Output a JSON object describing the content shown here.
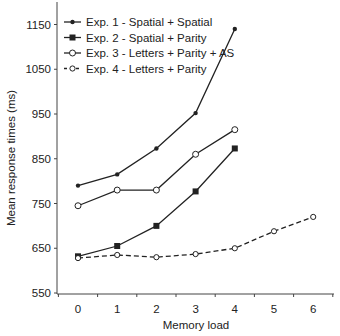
{
  "chart_data": {
    "type": "line",
    "title": "",
    "xlabel": "Memory load",
    "ylabel": "Mean response times (ms)",
    "xlim": [
      -0.5,
      6.5
    ],
    "ylim": [
      550,
      1200
    ],
    "xticks": [
      0,
      1,
      2,
      3,
      4,
      5,
      6
    ],
    "yticks": [
      550,
      650,
      750,
      850,
      950,
      1050,
      1150
    ],
    "grid": false,
    "legend_position": "upper-left",
    "series": [
      {
        "name": "Exp. 1 - Spatial + Spatial",
        "marker": "small-filled-diamond",
        "line": "solid",
        "x": [
          0,
          1,
          2,
          3,
          4
        ],
        "values": [
          790,
          815,
          873,
          952,
          1140
        ]
      },
      {
        "name": "Exp. 2 - Spatial + Parity",
        "marker": "filled-square",
        "line": "solid",
        "x": [
          0,
          1,
          2,
          3,
          4
        ],
        "values": [
          632,
          655,
          700,
          777,
          873
        ]
      },
      {
        "name": "Exp. 3 - Letters + Parity + AS",
        "marker": "open-circle",
        "line": "solid",
        "x": [
          0,
          1,
          2,
          3,
          4
        ],
        "values": [
          745,
          780,
          780,
          860,
          915
        ]
      },
      {
        "name": "Exp. 4 - Letters + Parity",
        "marker": "open-circle-small",
        "line": "dashed",
        "x": [
          0,
          1,
          2,
          3,
          4,
          5,
          6
        ],
        "values": [
          628,
          635,
          630,
          637,
          650,
          688,
          720
        ]
      }
    ]
  },
  "colors": {
    "line": "#222222",
    "background": "#ffffff",
    "axis": "#444444"
  }
}
